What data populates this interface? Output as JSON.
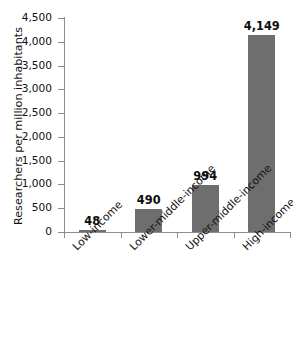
{
  "chart_data": {
    "type": "bar",
    "title": "",
    "xlabel": "",
    "ylabel": "Researchers per million inhabitants",
    "categories": [
      "Low-income",
      "Lower-middle-income",
      "Upper-middle-income",
      "High-income"
    ],
    "values": [
      48,
      490,
      994,
      4149
    ],
    "value_labels": [
      "48",
      "490",
      "994",
      "4,149"
    ],
    "ylim": [
      0,
      4500
    ],
    "ytick_values": [
      0,
      500,
      1000,
      1500,
      2000,
      2500,
      3000,
      3500,
      4000,
      4500
    ],
    "ytick_labels": [
      "0",
      "500",
      "1,000",
      "1,500",
      "2,000",
      "2,500",
      "3,000",
      "3,500",
      "4,000",
      "4,500"
    ],
    "grid": false,
    "legend": false,
    "legend_position": "none",
    "bar_color": "#6e6e6e",
    "axis_color": "#8d8d8d",
    "background_color": "#ffffff",
    "xlabel_rotation": -45
  }
}
